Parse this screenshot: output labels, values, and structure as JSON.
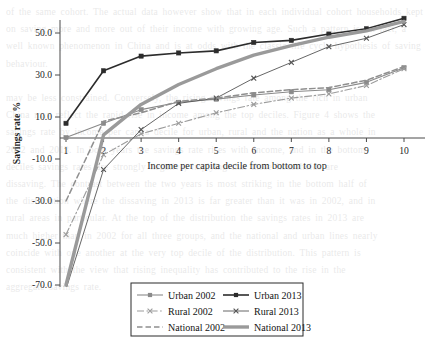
{
  "chart_data": {
    "type": "line",
    "title": "",
    "xlabel": "Income per capita decile from bottom to top",
    "ylabel": "Savings rate %",
    "x": [
      1,
      2,
      3,
      4,
      5,
      6,
      7,
      8,
      9,
      10
    ],
    "categories": [
      "1",
      "2",
      "3",
      "4",
      "5",
      "6",
      "7",
      "8",
      "9",
      "10"
    ],
    "xtick_labels": [
      "1",
      "2",
      "3",
      "4",
      "5",
      "6",
      "7",
      "8",
      "9",
      "10"
    ],
    "ytick_labels": [
      "50.0",
      "30.0",
      "10.0",
      "-10.0",
      "-30.0",
      "-50.0",
      "-70.0"
    ],
    "ytick_values": [
      50,
      30,
      10,
      -10,
      -30,
      -50,
      -70
    ],
    "ylim": [
      -75,
      60
    ],
    "xlim": [
      0.6,
      10.4
    ],
    "grid": false,
    "legend_position": "bottom-center",
    "series": [
      {
        "name": "Urban 2002",
        "values": [
          0.2,
          7.0,
          13.5,
          17.0,
          18.5,
          20.5,
          22.0,
          23.0,
          26.5,
          33.5
        ],
        "color": "#8a8a8a",
        "style": "solid-thin-square"
      },
      {
        "name": "Urban 2013",
        "values": [
          7.0,
          32.0,
          39.0,
          40.5,
          41.5,
          45.5,
          46.5,
          49.5,
          52.0,
          57.0
        ],
        "color": "#2c2c2c",
        "style": "solid-square"
      },
      {
        "name": "Rural 2002",
        "values": [
          -46.0,
          -8.0,
          2.0,
          7.0,
          12.0,
          16.0,
          19.0,
          21.0,
          25.0,
          33.0
        ],
        "color": "#9c9c9c",
        "style": "dash-dot-cross"
      },
      {
        "name": "Rural 2013",
        "values": [
          -72.0,
          -15.0,
          4.0,
          16.5,
          19.0,
          28.5,
          36.0,
          43.5,
          47.5,
          54.0
        ],
        "color": "#555555",
        "style": "solid-thin-cross"
      },
      {
        "name": "National 2002",
        "values": [
          -30.0,
          8.0,
          12.0,
          17.5,
          19.0,
          21.5,
          23.0,
          24.0,
          27.5,
          34.0
        ],
        "color": "#8f8f8f",
        "style": "dashed"
      },
      {
        "name": "National 2013",
        "values": [
          -70.0,
          1.5,
          16.0,
          25.5,
          33.0,
          39.5,
          44.0,
          48.0,
          51.0,
          55.5
        ],
        "color": "#9a9a9a",
        "style": "thick-solid"
      }
    ]
  },
  "legend": {
    "entries": [
      {
        "label": "Urban 2002"
      },
      {
        "label": "Urban 2013"
      },
      {
        "label": "Rural 2002"
      },
      {
        "label": "Rural 2013"
      },
      {
        "label": "National 2002"
      },
      {
        "label": "National 2013"
      }
    ]
  },
  "colors": {
    "axis": "#4a4a4a",
    "text": "#1f1f1f",
    "legend_border": "#2b2b2b",
    "background": "#ffffff"
  },
  "background_text": "of the same cohort. The actual data however show that in each individual cohort households kept on saving more and more out of their income with growing age. Such a pattern is, in fact, a well known phenomenon in China and is at odds with the classic life cycle hypothesis of saving behaviour.\n\nmay be less constrained. Conversely, the rising savings rate among the rich in urban\nChina may reflect the rapid rise in income among the top deciles. Figure 4 shows the\nsavings rate by income per capita decile for urban, rural and the nation as a whole in\n2002 and 2013. In both years the savings rate rises with income, and in the bottom\ndeciles savings rates are strongly negative, implying that these households are\ndissaving. The contrast between the two years is most striking in the bottom half of\nthe distribution where the dissaving in 2013 is far greater than it was in 2002, and in\nrural areas in particular. At the top of the distribution the savings rates in 2013 are\nmuch higher than in 2002 for all three groups, and the national and urban lines nearly\ncoincide with one another at the very top decile of the distribution. This pattern is\nconsistent with the view that rising inequality has contributed to the rise in the\naggregate savings rate."
}
